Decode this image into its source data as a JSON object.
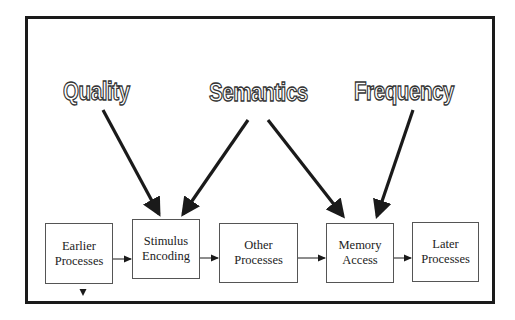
{
  "diagram": {
    "factors": [
      {
        "id": "quality",
        "label": "Quality"
      },
      {
        "id": "semantics",
        "label": "Semantics"
      },
      {
        "id": "frequency",
        "label": "Frequency"
      }
    ],
    "stages": [
      {
        "id": "earlier",
        "line1": "Earlier",
        "line2": "Processes"
      },
      {
        "id": "stimulus",
        "line1": "Stimulus",
        "line2": "Encoding"
      },
      {
        "id": "other",
        "line1": "Other",
        "line2": "Processes"
      },
      {
        "id": "memory",
        "line1": "Memory",
        "line2": "Access"
      },
      {
        "id": "later",
        "line1": "Later",
        "line2": "Processes"
      }
    ],
    "influences": [
      {
        "from": "Quality",
        "to": "Stimulus Encoding"
      },
      {
        "from": "Semantics",
        "to": "Stimulus Encoding"
      },
      {
        "from": "Semantics",
        "to": "Memory Access"
      },
      {
        "from": "Frequency",
        "to": "Memory Access"
      }
    ],
    "flow": [
      "Earlier Processes",
      "Stimulus Encoding",
      "Other Processes",
      "Memory Access",
      "Later Processes"
    ],
    "colors": {
      "stroke": "#1a1a1a",
      "box_border": "#555555",
      "background": "#ffffff"
    }
  }
}
